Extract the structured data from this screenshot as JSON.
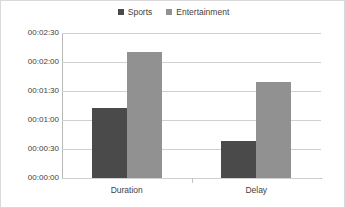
{
  "chart_data": {
    "type": "bar",
    "title": "",
    "subtitle": "",
    "xlabel": "",
    "ylabel": "",
    "categories": [
      "Duration",
      "Delay"
    ],
    "series": [
      {
        "name": "Sports",
        "color": "#4a4a4a",
        "values": [
          72,
          38
        ],
        "value_labels": [
          "00:01:12",
          "00:00:38"
        ]
      },
      {
        "name": "Entertainment",
        "color": "#919191",
        "values": [
          130,
          99
        ],
        "value_labels": [
          "00:02:10",
          "00:01:39"
        ]
      }
    ],
    "value_unit": "seconds",
    "ylim": [
      0,
      150
    ],
    "ytick_values": [
      0,
      30,
      60,
      90,
      120,
      150
    ],
    "ytick_labels": [
      "00:00:00",
      "00:00:30",
      "00:01:00",
      "00:01:30",
      "00:02:00",
      "00:02:30"
    ],
    "grid": true,
    "grid_axis": "y",
    "legend_position": "top-center",
    "legend_marker": "square",
    "background_color": "#ffffff",
    "gridline_color": "#d0d0d0",
    "border_color": "#d9d9d9"
  },
  "legend": {
    "entries": [
      {
        "label": "Sports",
        "color": "#4a4a4a"
      },
      {
        "label": "Entertainment",
        "color": "#919191"
      }
    ]
  },
  "axes": {
    "y": {
      "labels": [
        "00:02:30",
        "00:02:00",
        "00:01:30",
        "00:01:00",
        "00:00:30",
        "00:00:00"
      ]
    },
    "x": {
      "labels": [
        "Duration",
        "Delay"
      ]
    }
  }
}
